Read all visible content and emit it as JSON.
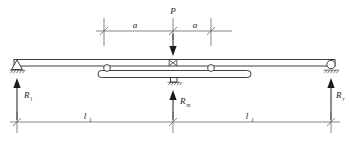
{
  "figure": {
    "type": "structural-free-body-diagram",
    "background_color": "#ffffff",
    "line_color": "#3a3a3a",
    "label_color": "#1a1a1a"
  },
  "load": {
    "name": "point-load",
    "label": "P",
    "direction": "downward",
    "position": "midspan"
  },
  "dimensions_top": {
    "left": {
      "label": "a"
    },
    "right": {
      "label": "a"
    }
  },
  "dimensions_bottom": {
    "left": {
      "label": "l",
      "subscript": "1"
    },
    "right": {
      "label": "l",
      "subscript": "1"
    }
  },
  "reactions": [
    {
      "name": "left-reaction",
      "label": "R",
      "subscript": "l",
      "direction": "upward"
    },
    {
      "name": "middle-reaction",
      "label": "R",
      "subscript": "m",
      "direction": "upward"
    },
    {
      "name": "right-reaction",
      "label": "R",
      "subscript": "r",
      "direction": "upward"
    }
  ],
  "supports": {
    "left": {
      "type": "pinned-support"
    },
    "right": {
      "type": "roller-support"
    },
    "middle": {
      "type": "fixed-block-support"
    }
  },
  "members": {
    "upper_beam": {
      "name": "upper-beam"
    },
    "lower_beam": {
      "name": "lower-equalizing-beam"
    },
    "center_hinge": {
      "name": "center-hinge"
    },
    "rollers": [
      {
        "name": "lower-beam-left-roller"
      },
      {
        "name": "lower-beam-right-roller"
      }
    ]
  }
}
